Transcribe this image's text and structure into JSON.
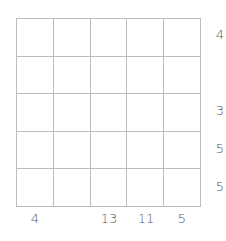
{
  "puzzle": {
    "rows": 5,
    "cols": 5,
    "right_clues": [
      "4",
      "",
      "3",
      "5",
      "5"
    ],
    "bottom_clues": [
      "4",
      "",
      "13",
      "11",
      "5"
    ]
  }
}
